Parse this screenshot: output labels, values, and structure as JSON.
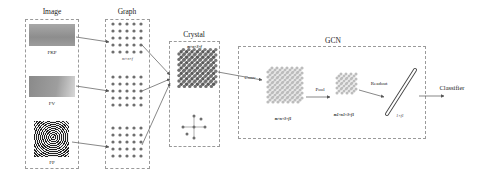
{
  "columns": {
    "image": {
      "title": "Image",
      "items": [
        {
          "label": "FKP"
        },
        {
          "label": "FV"
        },
        {
          "label": "FP"
        }
      ]
    },
    "graph": {
      "title": "Graph",
      "dim_label": "m×n×f"
    },
    "crystal": {
      "title": "Crystal",
      "dim_label": "m×n×3×f"
    },
    "gcn": {
      "title": "GCN",
      "conv_label": "Conv",
      "pool_label": "Pool",
      "readout_label": "Readout",
      "conv_dim": "m×n×3×f1",
      "pool_dim": "m1×n1×3×f1",
      "readout_dim": "1×f1"
    },
    "classifier": {
      "label": "Classifier"
    }
  },
  "colors": {
    "node": "#6e6e6e",
    "node_light": "#b8b8b8",
    "border": "#9a9a9a",
    "arrow": "#555555"
  }
}
